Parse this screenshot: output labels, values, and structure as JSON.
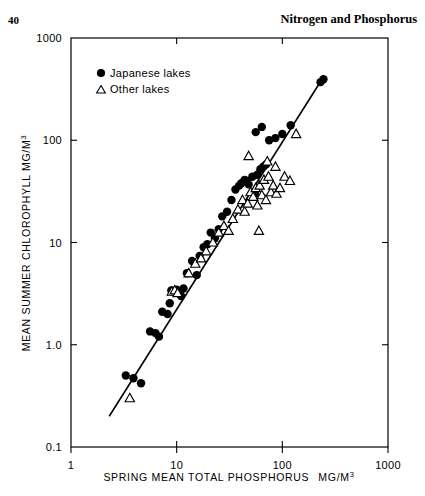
{
  "page": {
    "folio": "40",
    "running_head": "Nitrogen and Phosphorus"
  },
  "chart_data": {
    "type": "scatter",
    "title": "",
    "xlabel": "SPRING MEAN TOTAL PHOSPHORUS  MG/M3",
    "xlabel_main": "SPRING MEAN TOTAL PHOSPHORUS",
    "xlabel_units": "MG/M",
    "xlabel_units_exp": "3",
    "ylabel_main": "MEAN SUMMER CHLOROPHYLL  MG/M",
    "ylabel_units_exp": "3",
    "xscale": "log",
    "yscale": "log",
    "xlim": [
      1,
      1000
    ],
    "ylim": [
      0.1,
      1000
    ],
    "xticks": [
      1,
      10,
      100,
      1000
    ],
    "xtick_labels": [
      "1",
      "10",
      "100",
      "1000"
    ],
    "yticks": [
      0.1,
      1.0,
      10,
      100,
      1000
    ],
    "ytick_labels": [
      "0.1",
      "1.0",
      "10",
      "100",
      "1000"
    ],
    "grid": false,
    "legend_position": "top-left",
    "legend": [
      {
        "marker": "filled-circle",
        "label": "Japanese lakes",
        "color": "#000000"
      },
      {
        "marker": "open-triangle",
        "label": "Other lakes",
        "color": "#000000"
      }
    ],
    "fit_line": {
      "label": "regression line",
      "x_start": 2.3,
      "y_start": 0.2,
      "x_end": 250.0,
      "y_end": 430.0
    },
    "series": [
      {
        "name": "Japanese lakes",
        "marker": "filled-circle",
        "points": [
          [
            3.3,
            0.5
          ],
          [
            3.9,
            0.47
          ],
          [
            4.6,
            0.42
          ],
          [
            5.6,
            1.35
          ],
          [
            6.3,
            1.3
          ],
          [
            6.8,
            1.2
          ],
          [
            7.3,
            2.1
          ],
          [
            8.2,
            2.0
          ],
          [
            8.6,
            2.55
          ],
          [
            8.9,
            3.4
          ],
          [
            9.4,
            3.3
          ],
          [
            10.0,
            3.45
          ],
          [
            10.6,
            3.2
          ],
          [
            11.0,
            3.0
          ],
          [
            11.6,
            3.55
          ],
          [
            12.5,
            5.0
          ],
          [
            14.0,
            6.6
          ],
          [
            15.5,
            4.8
          ],
          [
            16.5,
            7.4
          ],
          [
            18.0,
            9.0
          ],
          [
            19.5,
            9.6
          ],
          [
            21.0,
            12.5
          ],
          [
            23.0,
            11.0
          ],
          [
            25.0,
            13.5
          ],
          [
            27.0,
            18.0
          ],
          [
            30.0,
            20.0
          ],
          [
            33.0,
            26.0
          ],
          [
            36.0,
            33.0
          ],
          [
            39.0,
            36.0
          ],
          [
            41.0,
            38.0
          ],
          [
            44.0,
            41.0
          ],
          [
            46.0,
            40.0
          ],
          [
            48.0,
            37.0
          ],
          [
            52.0,
            44.0
          ],
          [
            55.0,
            30.0
          ],
          [
            58.0,
            46.0
          ],
          [
            62.0,
            52.0
          ],
          [
            66.0,
            55.0
          ],
          [
            70.0,
            58.0
          ],
          [
            56.0,
            120.0
          ],
          [
            64.0,
            135.0
          ],
          [
            75.0,
            100.0
          ],
          [
            86.0,
            105.0
          ],
          [
            100.0,
            115.0
          ],
          [
            120.0,
            140.0
          ],
          [
            230.0,
            370.0
          ],
          [
            245.0,
            395.0
          ]
        ]
      },
      {
        "name": "Other lakes",
        "marker": "open-triangle",
        "points": [
          [
            3.6,
            0.3
          ],
          [
            9.0,
            3.3
          ],
          [
            9.6,
            3.4
          ],
          [
            10.2,
            3.2
          ],
          [
            13.0,
            5.0
          ],
          [
            15.0,
            6.2
          ],
          [
            17.0,
            7.0
          ],
          [
            19.0,
            8.2
          ],
          [
            22.0,
            10.0
          ],
          [
            25.0,
            12.5
          ],
          [
            28.0,
            14.5
          ],
          [
            31.0,
            13.0
          ],
          [
            34.0,
            17.0
          ],
          [
            38.0,
            21.0
          ],
          [
            42.0,
            26.0
          ],
          [
            44.0,
            20.0
          ],
          [
            47.0,
            24.0
          ],
          [
            50.0,
            31.0
          ],
          [
            53.0,
            28.0
          ],
          [
            56.0,
            34.0
          ],
          [
            58.0,
            23.0
          ],
          [
            61.0,
            36.0
          ],
          [
            64.0,
            29.0
          ],
          [
            67.0,
            41.0
          ],
          [
            70.0,
            26.0
          ],
          [
            74.0,
            44.0
          ],
          [
            78.0,
            31.0
          ],
          [
            82.0,
            36.0
          ],
          [
            88.0,
            30.0
          ],
          [
            95.0,
            34.0
          ],
          [
            60.0,
            13.0
          ],
          [
            48.0,
            70.0
          ],
          [
            72.0,
            62.0
          ],
          [
            86.0,
            55.0
          ],
          [
            105.0,
            44.0
          ],
          [
            118.0,
            40.0
          ],
          [
            135.0,
            115.0
          ]
        ]
      }
    ]
  }
}
